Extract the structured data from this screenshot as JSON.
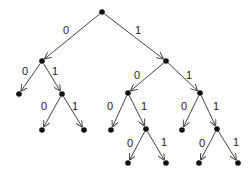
{
  "diagram": {
    "type": "binary-tree",
    "colors": {
      "node": "#111111",
      "edge": "#444444",
      "label": "#222222",
      "background": "#ffffff"
    },
    "nodes": [
      {
        "id": "root",
        "x": 102,
        "y": 12
      },
      {
        "id": "n0",
        "x": 42,
        "y": 61
      },
      {
        "id": "n1",
        "x": 166,
        "y": 61
      },
      {
        "id": "n00",
        "x": 19,
        "y": 94
      },
      {
        "id": "n01",
        "x": 62,
        "y": 94
      },
      {
        "id": "n010",
        "x": 42,
        "y": 130
      },
      {
        "id": "n011",
        "x": 84,
        "y": 130
      },
      {
        "id": "n10",
        "x": 128,
        "y": 93
      },
      {
        "id": "n11",
        "x": 200,
        "y": 93
      },
      {
        "id": "n100",
        "x": 111,
        "y": 130
      },
      {
        "id": "n101",
        "x": 146,
        "y": 129
      },
      {
        "id": "n1010",
        "x": 128,
        "y": 163
      },
      {
        "id": "n1011",
        "x": 166,
        "y": 163
      },
      {
        "id": "n110",
        "x": 182,
        "y": 130
      },
      {
        "id": "n111",
        "x": 217,
        "y": 129
      },
      {
        "id": "n1110",
        "x": 199,
        "y": 163
      },
      {
        "id": "n1111",
        "x": 238,
        "y": 163
      }
    ],
    "edges": [
      {
        "from": "root",
        "to": "n0",
        "label": "0",
        "lx": 66,
        "ly": 34
      },
      {
        "from": "root",
        "to": "n1",
        "label": "1",
        "lx": 138,
        "ly": 34
      },
      {
        "from": "n0",
        "to": "n00",
        "label": "0",
        "lx": 25,
        "ly": 75
      },
      {
        "from": "n0",
        "to": "n01",
        "label": "1",
        "lx": 55,
        "ly": 75
      },
      {
        "from": "n01",
        "to": "n010",
        "label": "0",
        "lx": 44,
        "ly": 110
      },
      {
        "from": "n01",
        "to": "n011",
        "label": "1",
        "lx": 75,
        "ly": 110
      },
      {
        "from": "n1",
        "to": "n10",
        "label": "0",
        "lx": 137,
        "ly": 79
      },
      {
        "from": "n1",
        "to": "n11",
        "label": "1",
        "lx": 189,
        "ly": 79
      },
      {
        "from": "n10",
        "to": "n100",
        "label": "0",
        "lx": 110,
        "ly": 110
      },
      {
        "from": "n10",
        "to": "n101",
        "label": "1",
        "lx": 144,
        "ly": 110
      },
      {
        "from": "n101",
        "to": "n1010",
        "label": "0",
        "lx": 130,
        "ly": 147
      },
      {
        "from": "n101",
        "to": "n1011",
        "label": "1",
        "lx": 164,
        "ly": 146
      },
      {
        "from": "n11",
        "to": "n110",
        "label": "0",
        "lx": 184,
        "ly": 110
      },
      {
        "from": "n11",
        "to": "n111",
        "label": "1",
        "lx": 216,
        "ly": 110
      },
      {
        "from": "n111",
        "to": "n1110",
        "label": "0",
        "lx": 202,
        "ly": 147
      },
      {
        "from": "n111",
        "to": "n1111",
        "label": "1",
        "lx": 236,
        "ly": 146
      }
    ]
  }
}
